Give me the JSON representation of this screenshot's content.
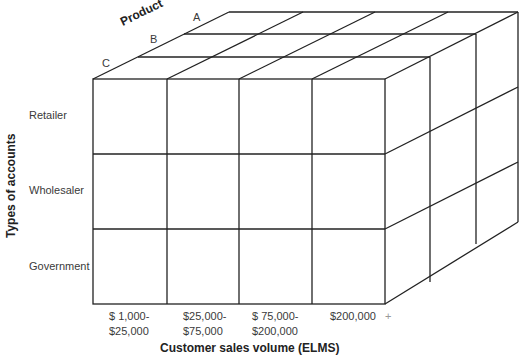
{
  "diagram": {
    "type": "3d-cube-matrix",
    "axes": {
      "depth": {
        "title": "Product",
        "items": [
          "A",
          "B",
          "C"
        ]
      },
      "vertical": {
        "title": "Types of accounts",
        "items": [
          "Retailer",
          "Wholesaler",
          "Government"
        ]
      },
      "horizontal": {
        "title": "Customer sales volume (ELMS)",
        "items": [
          {
            "line1": "$  1,000-",
            "line2": "$25,000"
          },
          {
            "line1": "$25,000-",
            "line2": "$75,000"
          },
          {
            "line1": "$  75,000-",
            "line2": "$200,000"
          },
          {
            "line1": "$200,000",
            "line2": ""
          }
        ],
        "last_suffix": "+"
      }
    },
    "line_color": "#222222"
  }
}
